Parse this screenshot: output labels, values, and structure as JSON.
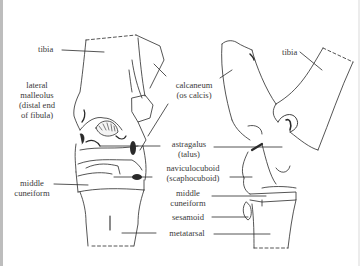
{
  "diagram": {
    "type": "anatomical line drawing",
    "views": [
      "front view (left)",
      "side view (right)"
    ],
    "ink_color": "#2a2a2a",
    "label_color": "#3a3a3a",
    "background": "#ffffff"
  },
  "labels": {
    "tibia_left": "tibia",
    "lateral_malleolus": [
      "lateral",
      "malleolus",
      "(distal end",
      "of fibula)"
    ],
    "calcaneum": [
      "calcaneum",
      "(os calcis)"
    ],
    "astragalus": [
      "astragalus",
      "(talus)"
    ],
    "naviculocuboid": [
      "naviculocuboid",
      "(scaphocuboid)"
    ],
    "middle_cuneiform_left": [
      "middle",
      "cuneiform"
    ],
    "middle_cuneiform_center": [
      "middle",
      "cuneiform"
    ],
    "sesamoid": "sesamoid",
    "metatarsal": "metatarsal",
    "tibia_right": "tibia"
  }
}
